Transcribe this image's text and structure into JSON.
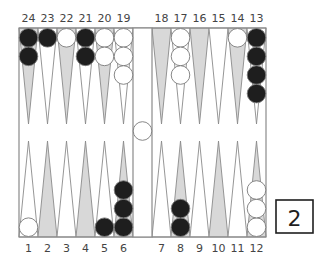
{
  "board": {
    "colors": {
      "background": "#ffffff",
      "frame": "#8a8a8a",
      "point_light": "#ffffff",
      "point_dark": "#d8d8d8",
      "point_outline": "#8a8a8a",
      "black_checker": "#1e1e1e",
      "white_checker": "#ffffff",
      "checker_outline": "#7a7a7a",
      "label": "#444444"
    },
    "top_labels": [
      "24",
      "23",
      "22",
      "21",
      "20",
      "19",
      "18",
      "17",
      "16",
      "15",
      "14",
      "13"
    ],
    "bottom_labels": [
      "1",
      "2",
      "3",
      "4",
      "5",
      "6",
      "7",
      "8",
      "9",
      "10",
      "11",
      "12"
    ],
    "top_points": [
      {
        "point": 24,
        "shade": "dark",
        "color": "black",
        "count": 2
      },
      {
        "point": 23,
        "shade": "light",
        "color": "black",
        "count": 1
      },
      {
        "point": 22,
        "shade": "dark",
        "color": "white",
        "count": 1
      },
      {
        "point": 21,
        "shade": "light",
        "color": "black",
        "count": 2
      },
      {
        "point": 20,
        "shade": "dark",
        "color": "white",
        "count": 2
      },
      {
        "point": 19,
        "shade": "light",
        "color": "white",
        "count": 3
      },
      {
        "point": 18,
        "shade": "dark",
        "color": "none",
        "count": 0
      },
      {
        "point": 17,
        "shade": "light",
        "color": "white",
        "count": 3
      },
      {
        "point": 16,
        "shade": "dark",
        "color": "none",
        "count": 0
      },
      {
        "point": 15,
        "shade": "light",
        "color": "none",
        "count": 0
      },
      {
        "point": 14,
        "shade": "dark",
        "color": "white",
        "count": 1
      },
      {
        "point": 13,
        "shade": "light",
        "color": "black",
        "count": 4
      }
    ],
    "bottom_points": [
      {
        "point": 1,
        "shade": "light",
        "color": "white",
        "count": 1
      },
      {
        "point": 2,
        "shade": "dark",
        "color": "none",
        "count": 0
      },
      {
        "point": 3,
        "shade": "light",
        "color": "none",
        "count": 0
      },
      {
        "point": 4,
        "shade": "dark",
        "color": "none",
        "count": 0
      },
      {
        "point": 5,
        "shade": "light",
        "color": "black",
        "count": 1
      },
      {
        "point": 6,
        "shade": "dark",
        "color": "black",
        "count": 3
      },
      {
        "point": 7,
        "shade": "light",
        "color": "none",
        "count": 0
      },
      {
        "point": 8,
        "shade": "dark",
        "color": "black",
        "count": 2
      },
      {
        "point": 9,
        "shade": "light",
        "color": "none",
        "count": 0
      },
      {
        "point": 10,
        "shade": "dark",
        "color": "none",
        "count": 0
      },
      {
        "point": 11,
        "shade": "light",
        "color": "none",
        "count": 0
      },
      {
        "point": 12,
        "shade": "dark",
        "color": "white",
        "count": 3
      }
    ],
    "bar": {
      "white": 1,
      "black": 0
    }
  },
  "doubling_cube": {
    "value": "2"
  }
}
